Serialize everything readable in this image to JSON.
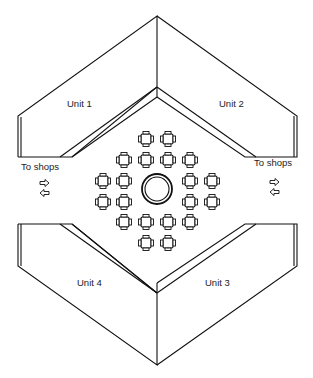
{
  "diagram": {
    "type": "floor-plan",
    "units": [
      {
        "id": "unit-1",
        "label": "Unit 1"
      },
      {
        "id": "unit-2",
        "label": "Unit 2"
      },
      {
        "id": "unit-3",
        "label": "Unit 3"
      },
      {
        "id": "unit-4",
        "label": "Unit 4"
      }
    ],
    "exits": [
      {
        "side": "left",
        "label": "To shops",
        "arrows": [
          "right-arrow",
          "left-arrow"
        ]
      },
      {
        "side": "right",
        "label": "To shops",
        "arrows": [
          "right-arrow",
          "left-arrow"
        ]
      }
    ],
    "center": {
      "feature": "circular-fountain",
      "table_count": 20
    },
    "colors": {
      "line": "#111111",
      "background": "#ffffff"
    }
  }
}
